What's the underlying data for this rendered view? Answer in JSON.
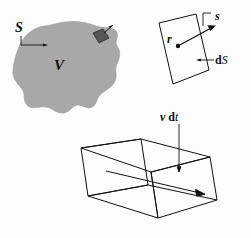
{
  "figure": {
    "background_color": "#fdfdfd",
    "stroke_color": "#111111",
    "blob_fill_color": "#a8a8a8",
    "patch_fill_color": "#555555"
  },
  "panels": {
    "volume": {
      "name": "closed-surface-volume",
      "surface_label": "S",
      "volume_label": "V",
      "patch_label": "",
      "blob_fill": "#a8a8a8",
      "patch_fill": "#555555"
    },
    "surface_element": {
      "name": "surface-element",
      "normal_label_bold": "s",
      "position_label_bold": "r",
      "area_label_prefix": "d",
      "area_label_symbol": "S"
    },
    "swept_volume": {
      "name": "swept-volume-prism",
      "velocity_label_bold": "v",
      "time_label_prefix": "d",
      "time_label_symbol": "t"
    }
  }
}
